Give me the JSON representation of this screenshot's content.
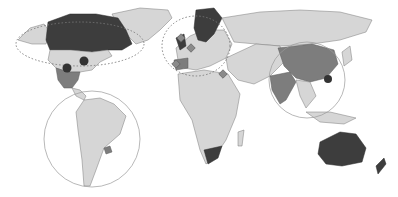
{
  "map": {
    "title": "",
    "style": "grayscale world map with highlighted countries",
    "colors": {
      "background": "#ffffff",
      "land": "#d6d6d6",
      "highlight_medium": "#7d7d7d",
      "highlight_dark": "#3d3d3d",
      "borders": "#7a7a7a"
    },
    "highlighted_regions": [
      {
        "name": "Canada",
        "shade": "dark"
      },
      {
        "name": "Mexico",
        "shade": "medium"
      },
      {
        "name": "Nordic countries",
        "shade": "dark"
      },
      {
        "name": "United Kingdom",
        "shade": "dark"
      },
      {
        "name": "Spain",
        "shade": "medium"
      },
      {
        "name": "China",
        "shade": "medium"
      },
      {
        "name": "India",
        "shade": "medium"
      },
      {
        "name": "Australia",
        "shade": "dark"
      },
      {
        "name": "South Africa",
        "shade": "dark"
      },
      {
        "name": "Uruguay",
        "shade": "medium"
      }
    ],
    "annotations": [
      {
        "type": "dotted-ellipse",
        "region": "North America"
      },
      {
        "type": "dotted-ellipse",
        "region": "Europe"
      },
      {
        "type": "solid-circle",
        "region": "South America"
      },
      {
        "type": "solid-circle",
        "region": "East Asia"
      }
    ],
    "markers": [
      {
        "type": "dot",
        "location": "USA Central"
      },
      {
        "type": "dot",
        "location": "USA East"
      },
      {
        "type": "dot",
        "location": "East China"
      },
      {
        "type": "diamond",
        "location": "United Kingdom"
      },
      {
        "type": "diamond",
        "location": "Central Europe"
      },
      {
        "type": "diamond",
        "location": "Iberia"
      },
      {
        "type": "diamond",
        "location": "Middle East"
      }
    ]
  }
}
